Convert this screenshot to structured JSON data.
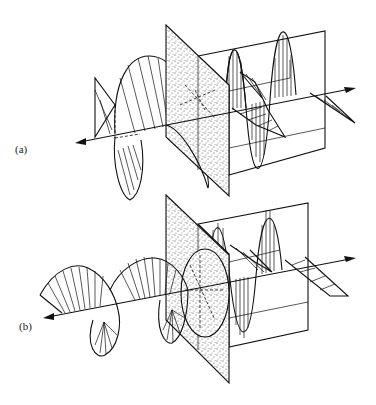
{
  "figure": {
    "type": "diagram",
    "panels": [
      {
        "id": "a",
        "label": "(a)",
        "left_wave": "helical (circularly polarized) ribbon",
        "element": "stippled polarizer plate",
        "right_wave": "two orthogonal linearly polarized sine components in a rectangular frame"
      },
      {
        "id": "b",
        "label": "(b)",
        "left_wave": "helical ribbon with elliptical cross-sections",
        "element": "stippled polarizer plate with elliptical aperture",
        "right_wave": "two orthogonal linearly polarized sine components in a rectangular frame"
      }
    ],
    "colors": {
      "ink": "#111111",
      "background": "#ffffff"
    }
  }
}
